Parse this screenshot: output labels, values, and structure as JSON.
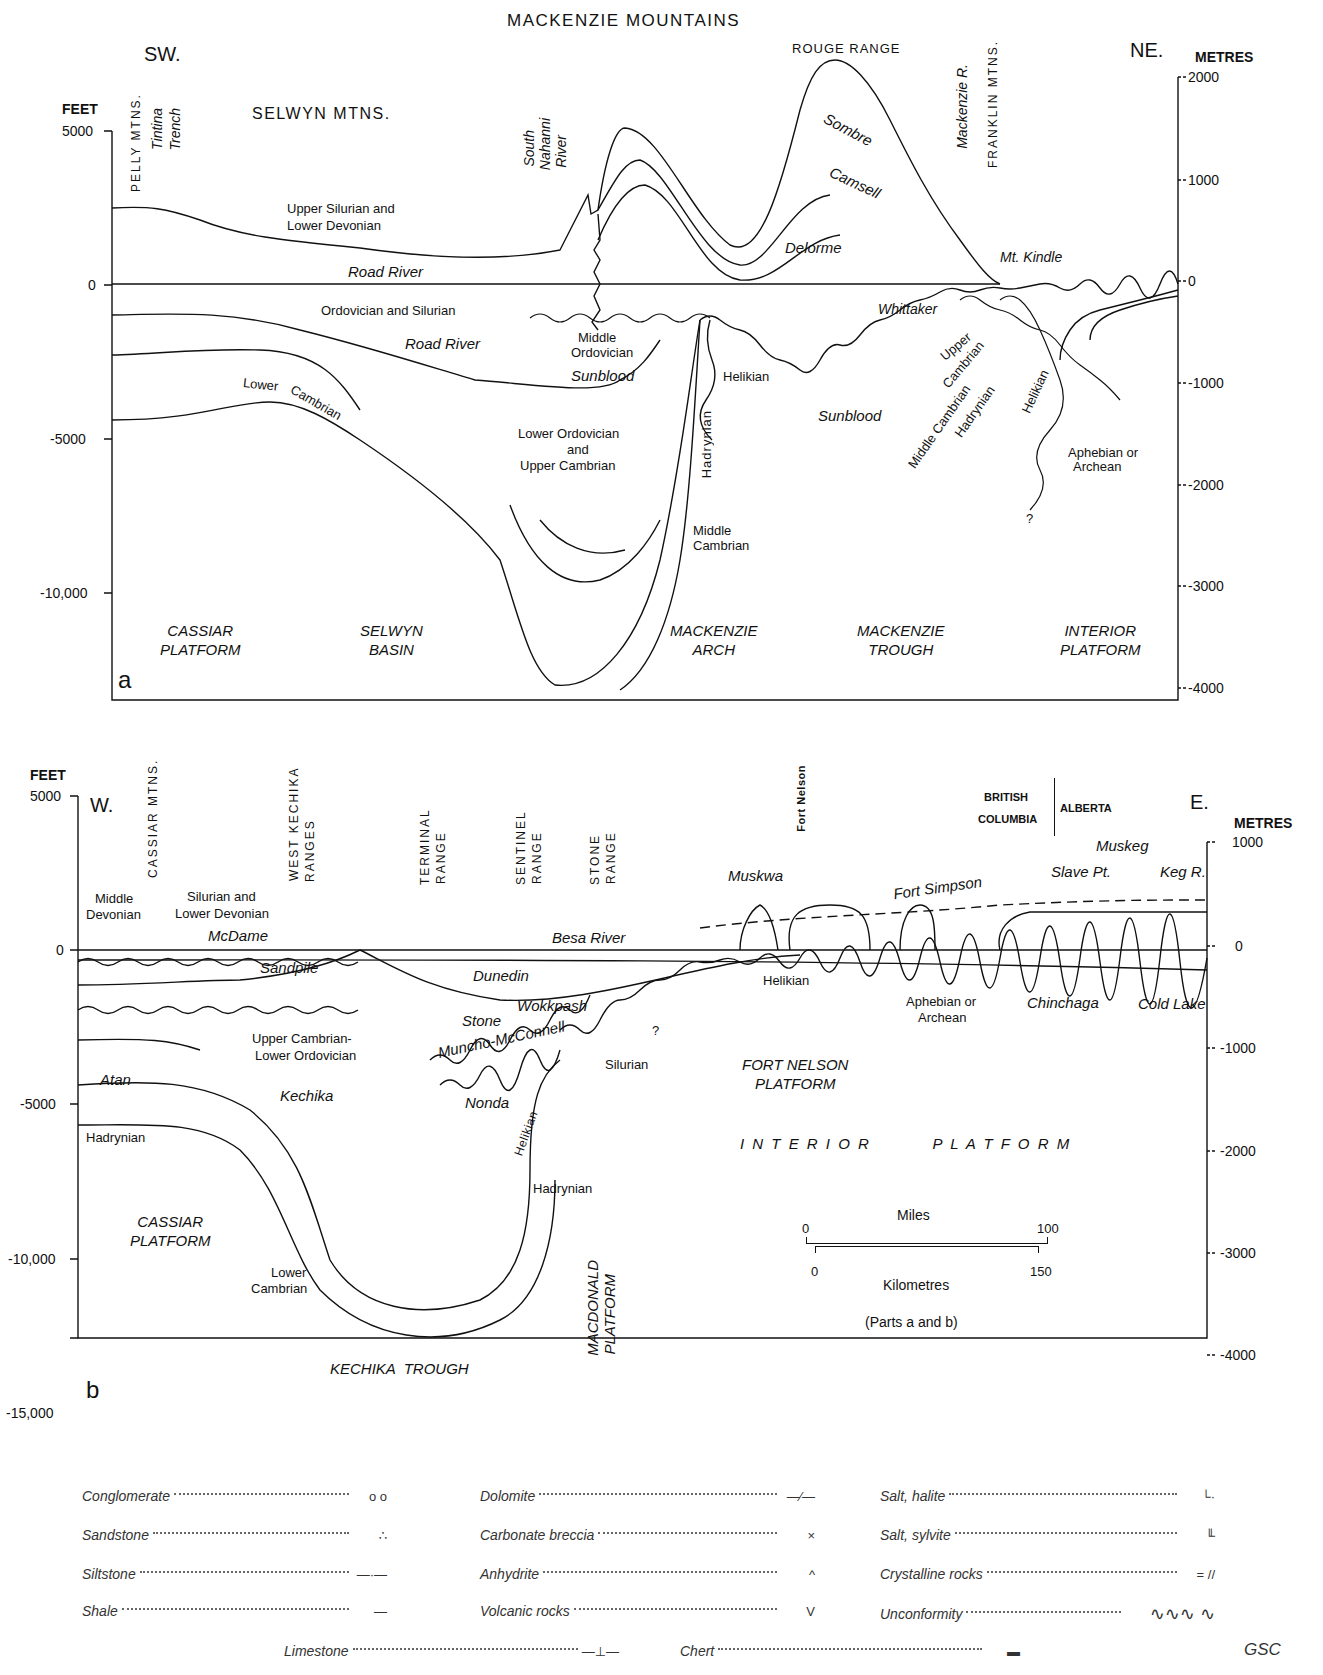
{
  "panel_a": {
    "title": "MACKENZIE MOUNTAINS",
    "letter": "a",
    "dir_left": "SW.",
    "dir_right": "NE.",
    "left_axis": {
      "unit": "FEET",
      "ticks": [
        "5000",
        "0",
        "-5000",
        "-10,000"
      ]
    },
    "right_axis": {
      "unit": "METRES",
      "ticks": [
        "2000",
        "1000",
        "0",
        "-1000",
        "-2000",
        "-3000",
        "-4000"
      ]
    },
    "range_labels": {
      "selwyn": "SELWYN MTNS.",
      "pelly": "PELLY MTNS.",
      "rouge": "ROUGE RANGE",
      "franklin": "FRANKLIN MTNS."
    },
    "place_labels": {
      "tintina": "Tintina",
      "trench": "Trench",
      "south": "South",
      "nahanni": "Nahanni",
      "river": "River",
      "mackenzie_r": "Mackenzie R."
    },
    "formations": {
      "upper_silurian_1": "Upper Silurian and",
      "upper_silurian_2": "Lower Devonian",
      "road_river_top": "Road River",
      "ord_sil": "Ordovician and Silurian",
      "road_river_mid": "Road River",
      "lower_cambrian_1": "Lower",
      "lower_cambrian_2": "Cambrian",
      "middle_ord_1": "Middle",
      "middle_ord_2": "Ordovician",
      "sunblood_1": "Sunblood",
      "lower_ord_1": "Lower Ordovician",
      "lower_ord_2": "and",
      "lower_ord_3": "Upper Cambrian",
      "middle_camb_1": "Middle",
      "middle_camb_2": "Cambrian",
      "hadrynian": "Hadrynian",
      "helikian_1": "Helikian",
      "sombre": "Sombre",
      "camsell": "Camsell",
      "delorme": "Delorme",
      "mt_kindle": "Mt. Kindle",
      "whittaker": "Whittaker",
      "sunblood_2": "Sunblood",
      "upper_camb_1": "Upper",
      "upper_camb_2": "Cambrian",
      "middle_cambrian_r": "Middle Cambrian",
      "hadrynian_r": "Hadrynian",
      "helikian_r": "Helikian",
      "aphebian_1": "Aphebian or",
      "aphebian_2": "Archean",
      "question": "?"
    },
    "provinces": [
      {
        "l1": "CASSIAR",
        "l2": "PLATFORM"
      },
      {
        "l1": "SELWYN",
        "l2": "BASIN"
      },
      {
        "l1": "MACKENZIE",
        "l2": "ARCH"
      },
      {
        "l1": "MACKENZIE",
        "l2": "TROUGH"
      },
      {
        "l1": "INTERIOR",
        "l2": "PLATFORM"
      }
    ]
  },
  "panel_b": {
    "letter": "b",
    "dir_left": "W.",
    "dir_right": "E.",
    "left_axis": {
      "unit": "FEET",
      "ticks": [
        "5000",
        "0",
        "-5000",
        "-10,000",
        "-15,000"
      ]
    },
    "right_axis": {
      "unit": "METRES",
      "ticks": [
        "1000",
        "0",
        "-1000",
        "-2000",
        "-3000",
        "-4000"
      ]
    },
    "range_labels": {
      "cassiar": "CASSIAR MTNS.",
      "west_kechika_1": "WEST KECHIKA",
      "west_kechika_2": "RANGES",
      "terminal_1": "TERMINAL",
      "terminal_2": "RANGE",
      "sentinel_1": "SENTINEL",
      "sentinel_2": "RANGE",
      "stone_1": "STONE",
      "stone_2": "RANGE",
      "fort_nelson": "Fort Nelson",
      "bc_1": "BRITISH",
      "bc_2": "COLUMBIA",
      "alberta": "ALBERTA"
    },
    "formations": {
      "middle_dev_1": "Middle",
      "middle_dev_2": "Devonian",
      "sil_dev_1": "Silurian and",
      "sil_dev_2": "Lower Devonian",
      "mcdame": "McDame",
      "besa_river": "Besa River",
      "sandpile": "Sandpile",
      "dunedin": "Dunedin",
      "wokkpash": "Wokkpash",
      "stone": "Stone",
      "muncho": "Muncho-McConnell",
      "silurian": "Silurian",
      "upper_camb_1": "Upper Cambrian-",
      "upper_camb_2": "Lower Ordovician",
      "kechika": "Kechika",
      "atan": "Atan",
      "nonda": "Nonda",
      "hadrynian_l": "Hadrynian",
      "helikian_v": "Helikian",
      "hadrynian_c": "Hadrynian",
      "lower_camb_1": "Lower",
      "lower_camb_2": "Cambrian",
      "muskwa": "Muskwa",
      "fort_simpson": "Fort Simpson",
      "slave_pt": "Slave Pt.",
      "muskeg": "Muskeg",
      "keg_r": "Keg R.",
      "helikian": "Helikian",
      "aphebian_1": "Aphebian or",
      "aphebian_2": "Archean",
      "chinchaga": "Chinchaga",
      "cold_lake": "Cold Lake",
      "question": "?"
    },
    "provinces": {
      "fort_nelson_1": "FORT NELSON",
      "fort_nelson_2": "PLATFORM",
      "interior": "I N T E R I O R          P L A T F O R M",
      "cassiar_1": "CASSIAR",
      "cassiar_2": "PLATFORM",
      "kechika_trough": "KECHIKA  TROUGH",
      "macdonald_1": "MACDONALD",
      "macdonald_2": "PLATFORM"
    },
    "scale_bar": {
      "miles_label": "Miles",
      "miles_start": "0",
      "miles_end": "100",
      "km_label": "Kilometres",
      "km_start": "0",
      "km_end": "150",
      "note": "(Parts a and b)"
    }
  },
  "legend": {
    "items": [
      {
        "label": "Conglomerate",
        "symbol": "o o"
      },
      {
        "label": "Sandstone",
        "symbol": "∴"
      },
      {
        "label": "Siltstone",
        "symbol": "—·—"
      },
      {
        "label": "Shale",
        "symbol": "—"
      },
      {
        "label": "Dolomite",
        "symbol": "—∕—"
      },
      {
        "label": "Carbonate breccia",
        "symbol": "×"
      },
      {
        "label": "Anhydrite",
        "symbol": "^"
      },
      {
        "label": "Volcanic rocks",
        "symbol": "V"
      },
      {
        "label": "Salt, halite",
        "symbol": "└·"
      },
      {
        "label": "Salt, sylvite",
        "symbol": "╙"
      },
      {
        "label": "Crystalline rocks",
        "symbol": "=  //"
      },
      {
        "label": "Unconformity",
        "symbol": "∿∿∿  ∿"
      },
      {
        "label": "Limestone",
        "symbol": "—⊥—"
      },
      {
        "label": "Chert",
        "symbol": "▬"
      }
    ],
    "credit": "GSC"
  }
}
